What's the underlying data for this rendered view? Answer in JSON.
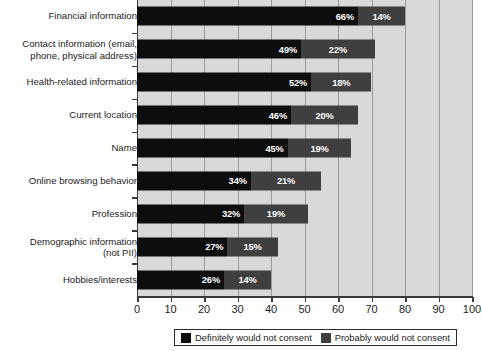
{
  "chart_data": {
    "type": "bar",
    "orientation": "horizontal",
    "stacked": true,
    "title": "",
    "xlabel": "",
    "ylabel": "",
    "xlim": [
      0,
      100
    ],
    "xticks": [
      0,
      10,
      20,
      30,
      40,
      50,
      60,
      70,
      80,
      90,
      100
    ],
    "xtick_labels": [
      "0",
      "10",
      "20",
      "30",
      "40",
      "50",
      "60",
      "70",
      "80",
      "90",
      "100"
    ],
    "grid": true,
    "grid_axis": "x",
    "legend_position": "bottom-center",
    "categories": [
      "Financial information",
      "Contact information (email,\nphone, physical address)",
      "Health-related information",
      "Current location",
      "Name",
      "Online browsing behavior",
      "Profession",
      "Demographic information\n(not PII)",
      "Hobbies/interests"
    ],
    "series": [
      {
        "name": "Definitely would not consent",
        "color": "#0d0d0d",
        "values": [
          66,
          49,
          52,
          46,
          45,
          34,
          32,
          27,
          26
        ],
        "labels": [
          "66%",
          "49%",
          "52%",
          "46%",
          "45%",
          "34%",
          "32%",
          "27%",
          "26%"
        ]
      },
      {
        "name": "Probably would not consent",
        "color": "#3f3f3f",
        "values": [
          14,
          22,
          18,
          20,
          19,
          21,
          19,
          15,
          14
        ],
        "labels": [
          "14%",
          "22%",
          "18%",
          "20%",
          "19%",
          "21%",
          "19%",
          "15%",
          "14%"
        ]
      }
    ],
    "totals": [
      80,
      71,
      70,
      66,
      64,
      55,
      51,
      42,
      40
    ]
  },
  "legend": {
    "items": [
      {
        "label": "Definitely would not consent",
        "swatch": "#0d0d0d"
      },
      {
        "label": "Probably would not consent",
        "swatch": "#3f3f3f"
      }
    ]
  },
  "colors": {
    "plot_background": "#d9d9d9",
    "gridline": "#9a9a9a",
    "axis": "#3a3a3a",
    "page_background": "#ffffff",
    "text": "#1c1c1c",
    "bar_label_text": "#ffffff"
  }
}
